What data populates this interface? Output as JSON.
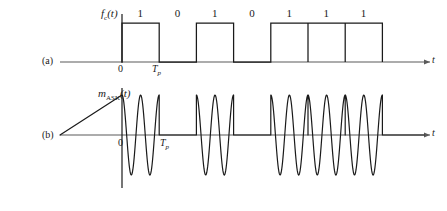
{
  "figure": {
    "panels": [
      {
        "id": "a",
        "label": "(a)",
        "signal_label": "f",
        "signal_sub": "c",
        "signal_suffix": "(t)",
        "axis_label": "t",
        "origin_label": "0",
        "period_label": "T",
        "period_sub": "p"
      },
      {
        "id": "b",
        "label": "(b)",
        "signal_label": "m",
        "signal_sub": "ASK",
        "signal_suffix": "(t)",
        "axis_label": "t",
        "origin_label": "0",
        "period_label": "T",
        "period_sub": "p"
      }
    ],
    "bits": [
      "1",
      "0",
      "1",
      "0",
      "1",
      "1",
      "1"
    ],
    "colors": {
      "line": "#1a1a1a",
      "axis": "#5a5a5a",
      "background": "#ffffff"
    }
  },
  "chart_data": {
    "type": "line",
    "title": "",
    "xlabel": "t",
    "ylabel": "",
    "bit_sequence": [
      1,
      0,
      1,
      0,
      1,
      1,
      1
    ],
    "bit_period_label": "Tp",
    "cycles_per_bit": 2,
    "series": [
      {
        "name": "f_c(t)",
        "description": "Binary NRZ unipolar baseband pulse train",
        "values": [
          1,
          0,
          1,
          0,
          1,
          1,
          1
        ],
        "ylim": [
          0,
          1
        ]
      },
      {
        "name": "m_ASK(t)",
        "description": "Amplitude shift keyed carrier, 2 cycles per bit, on when bit is 1",
        "values": [
          1,
          0,
          1,
          0,
          1,
          1,
          1
        ],
        "ylim": [
          -1,
          1
        ]
      }
    ],
    "grid": false,
    "legend": "none"
  }
}
